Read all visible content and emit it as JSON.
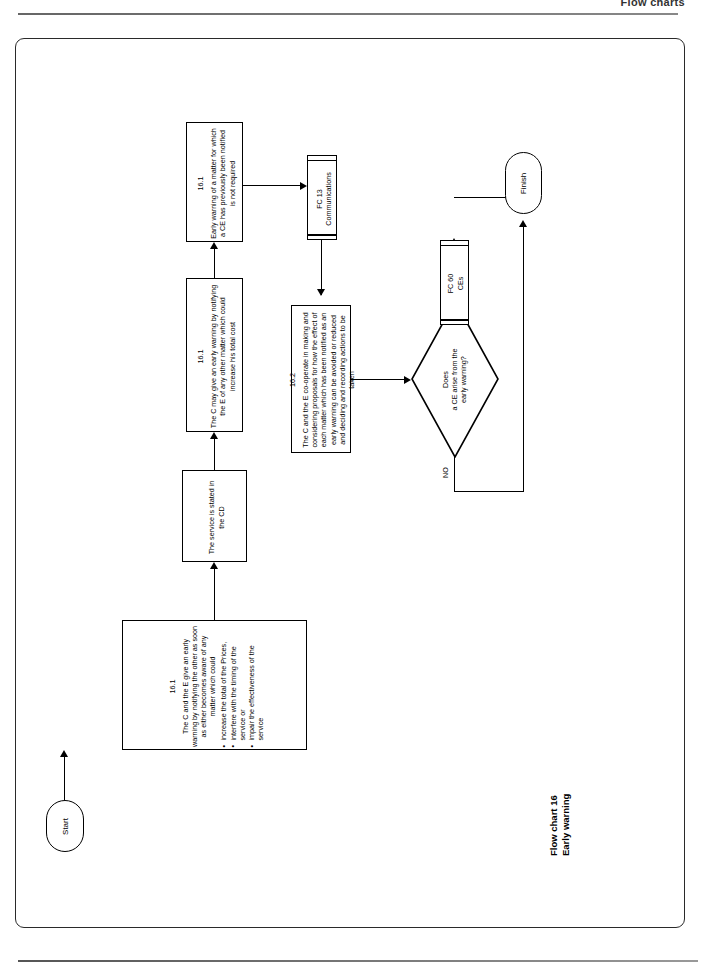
{
  "page": {
    "header_title": "Flow charts",
    "caption_line1": "Flow chart 16",
    "caption_line2": "Early warning"
  },
  "sections": {
    "early_warning": "EARLY WARNING",
    "co_operation": "CO-OPERATION"
  },
  "nodes": {
    "start": {
      "label": "Start"
    },
    "finish": {
      "label": "Finish"
    },
    "ew_main": {
      "clause": "16.1",
      "intro": "The C and the E give an early warning by notifying the other as soon as either becomes aware of any matter which could",
      "bullets": [
        "increase the total of the Prices,",
        "interfere with the timing of the service or",
        "impair the effectiveness of the service"
      ]
    },
    "service_cd": {
      "text": "The service is stated in the CD"
    },
    "ew_optional": {
      "clause": "16.1",
      "text": "The C may give an early warning by notifying the E of any other matter which could increase his total cost"
    },
    "ew_not_required": {
      "clause": "16.1",
      "text": "Early warning of a matter for which a CE has previously been notified is not required"
    },
    "fc13": {
      "line1": "FC 13",
      "line2": "Communications"
    },
    "cooperation": {
      "clause": "16.2",
      "text": "The C and the E co-operate in making and considering proposals for how the effect of each matter which has been notified as an early warning can be avoided or reduced and deciding and recording actions to be taken"
    },
    "fc60": {
      "line1": "FC 60",
      "line2": "CEs"
    },
    "decision": {
      "line1": "Does",
      "line2": "a CE arise from the",
      "line3": "early warning?"
    }
  },
  "edges": {
    "yes": "YES",
    "no": "NO"
  }
}
